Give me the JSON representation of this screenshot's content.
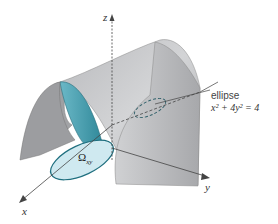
{
  "diagram": {
    "type": "3d-surface-illustration",
    "axes": {
      "x": "x",
      "y": "y",
      "z": "z"
    },
    "region_label": "Ω",
    "region_subscript": "xy",
    "annotation": {
      "title": "ellipse",
      "equation": "x² + 4y² = 4"
    },
    "colors": {
      "surface_light": "#c8c8ca",
      "surface_dark": "#8e8f92",
      "region_fill": "#cfe9f0",
      "region_edge": "#1f6f7f",
      "inner_cyan": "#4aa3b5",
      "axis": "#444444"
    }
  }
}
